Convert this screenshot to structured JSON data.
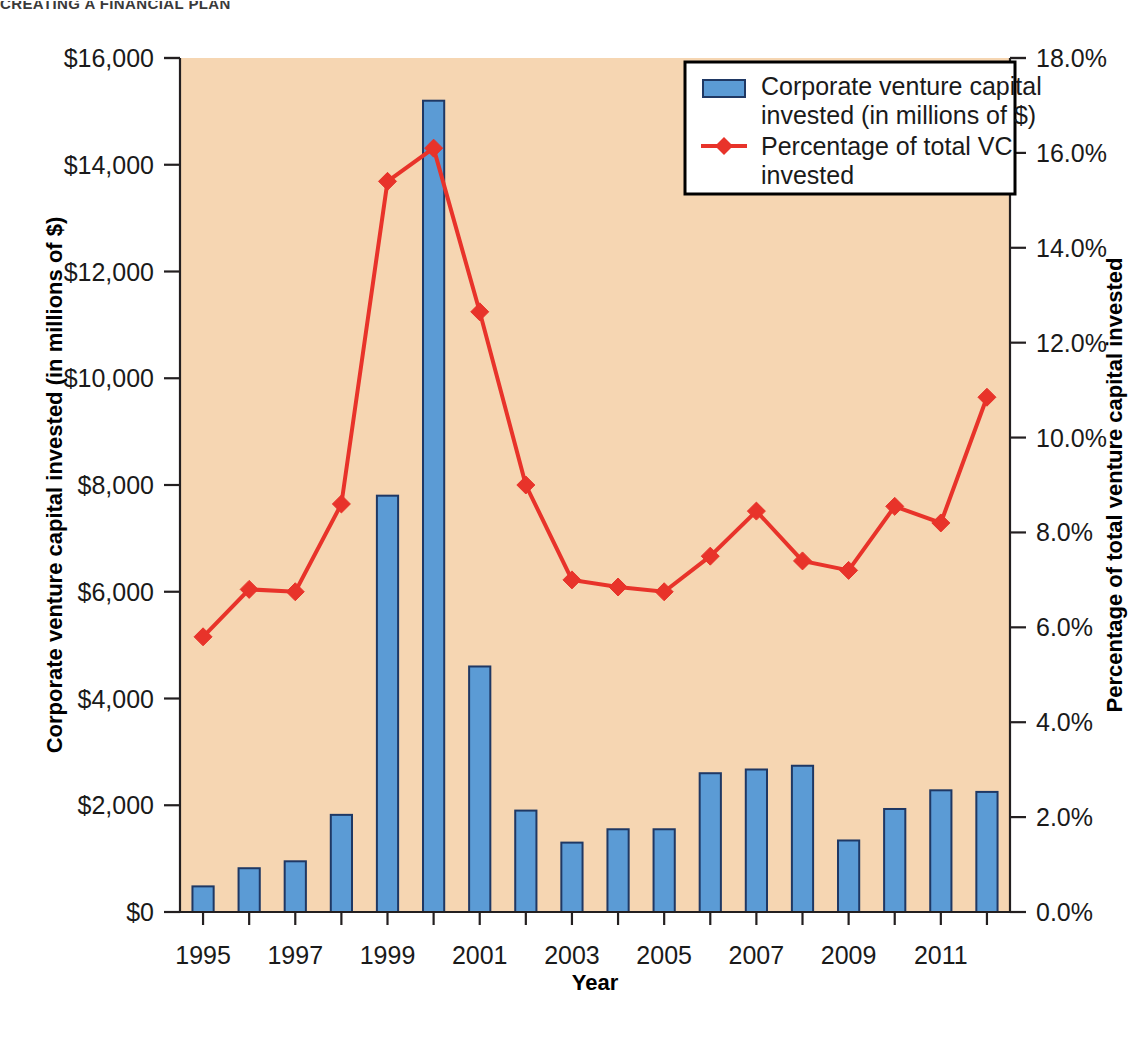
{
  "running_head": "CREATING A FINANCIAL PLAN",
  "colors": {
    "plot_background": "#f6d6b2",
    "bar_fill": "#5b9bd5",
    "bar_stroke": "#1f3864",
    "line": "#e8332a",
    "axis": "#231f20",
    "page_background": "#ffffff",
    "legend_background": "#ffffff"
  },
  "legend": {
    "position": "top-right",
    "items": [
      {
        "label": "Corporate venture capital invested (in millions of $)",
        "marker": "bar-swatch",
        "lines": [
          "Corporate venture capital",
          "invested (in millions of $)"
        ]
      },
      {
        "label": "Percentage of total VC invested",
        "marker": "line-diamond-marker",
        "lines": [
          "Percentage of total VC",
          "invested"
        ]
      }
    ]
  },
  "axes": {
    "x": {
      "title": "Year",
      "tick_labels": [
        "1995",
        "1997",
        "1999",
        "2001",
        "2003",
        "2005",
        "2007",
        "2009",
        "2011"
      ],
      "categories": [
        "1995",
        "1996",
        "1997",
        "1998",
        "1999",
        "2000",
        "2001",
        "2002",
        "2003",
        "2004",
        "2005",
        "2006",
        "2007",
        "2008",
        "2009",
        "2010",
        "2011",
        "2012"
      ]
    },
    "y_left": {
      "title": "Corporate venture capital invested (in millions of $)",
      "tick_labels": [
        "$0",
        "$2,000",
        "$4,000",
        "$6,000",
        "$8,000",
        "$10,000",
        "$12,000",
        "$14,000",
        "$16,000"
      ],
      "tick_values": [
        0,
        2000,
        4000,
        6000,
        8000,
        10000,
        12000,
        14000,
        16000
      ],
      "range": [
        0,
        16000
      ]
    },
    "y_right": {
      "title": "Percentage of total venture capital invested",
      "tick_labels": [
        "0.0%",
        "2.0%",
        "4.0%",
        "6.0%",
        "8.0%",
        "10.0%",
        "12.0%",
        "14.0%",
        "16.0%",
        "18.0%"
      ],
      "tick_values": [
        0,
        2,
        4,
        6,
        8,
        10,
        12,
        14,
        16,
        18
      ],
      "range": [
        0,
        18
      ]
    }
  },
  "chart_data": {
    "type": "bar",
    "title": "",
    "subtitle": "",
    "xlabel": "Year",
    "ylabel": "Corporate venture capital invested (in millions of $)",
    "y2label": "Percentage of total venture capital invested",
    "ylim": [
      0,
      16000
    ],
    "y2lim": [
      0,
      18
    ],
    "grid": false,
    "legend_position": "top-right",
    "categories": [
      "1995",
      "1996",
      "1997",
      "1998",
      "1999",
      "2000",
      "2001",
      "2002",
      "2003",
      "2004",
      "2005",
      "2006",
      "2007",
      "2008",
      "2009",
      "2010",
      "2011",
      "2012"
    ],
    "series": [
      {
        "name": "Corporate venture capital invested (in millions of $)",
        "type": "bar",
        "axis": "left",
        "color": "#5b9bd5",
        "values": [
          480,
          820,
          950,
          1820,
          7800,
          15200,
          4600,
          1900,
          1300,
          1550,
          1550,
          2600,
          2670,
          2740,
          1340,
          1930,
          2280,
          2250
        ]
      },
      {
        "name": "Percentage of total VC invested",
        "type": "line",
        "axis": "right",
        "color": "#e8332a",
        "marker": "diamond",
        "values": [
          5.8,
          6.8,
          6.75,
          8.6,
          15.4,
          16.1,
          12.65,
          9.0,
          7.0,
          6.85,
          6.75,
          7.5,
          8.45,
          7.4,
          7.2,
          8.55,
          8.2,
          10.85
        ]
      }
    ]
  }
}
